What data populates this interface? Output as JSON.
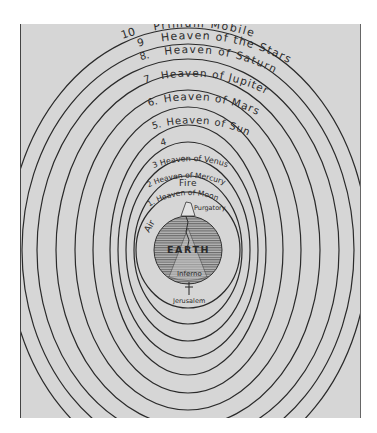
{
  "diagram": {
    "center_body": "EARTH",
    "spheres": [
      {
        "num": "10",
        "label": "Primum Mobile"
      },
      {
        "num": "9",
        "label": "Heaven of the Stars"
      },
      {
        "num": "8",
        "label": "Heaven of Saturn"
      },
      {
        "num": "7",
        "label": "Heaven of Jupiter"
      },
      {
        "num": "6",
        "label": "Heaven of Mars"
      },
      {
        "num": "5",
        "label": "Heaven of Sun"
      },
      {
        "num": "4",
        "label": "Heaven of Venus"
      },
      {
        "num": "3",
        "label": "Heaven of Mercury"
      },
      {
        "num": "2",
        "label": "Heaven of Moon"
      }
    ],
    "visible_labels": {
      "s10": "10",
      "s9_num": "9",
      "primum": "Primum Mobile",
      "s8_num": "8.",
      "stars": "Heaven of the Stars",
      "s7_num": "7",
      "saturn": "Heaven of Saturn",
      "s6_num": "6.",
      "jupiter": "Heaven of Jupiter",
      "s5_num": "5.",
      "mars": "Heaven of Mars",
      "s4_num": "4",
      "sun": "Heaven of Sun",
      "s3": "3 Heaven of Venus",
      "s2": "2 Heaven of Mercury",
      "s1": "1. Heaven of Moon",
      "fire": "Fire",
      "air": "Air",
      "earth": "EARTH",
      "purgatory": "Purgatory",
      "inferno": "Inferno",
      "jerusalem": "Jerusalem"
    },
    "colors": {
      "background": "#d6d6d6",
      "lines": "#2a2a2a",
      "earth_fill": "#9a9a9a"
    }
  }
}
